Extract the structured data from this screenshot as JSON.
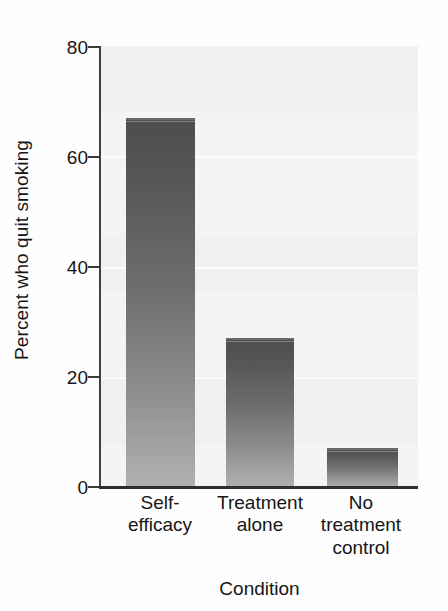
{
  "chart_data": {
    "type": "bar",
    "title": "",
    "xlabel": "Condition",
    "ylabel": "Percent who quit smoking",
    "categories": [
      "Self-\nefficacy",
      "Treatment\nalone",
      "No\ntreatment\ncontrol"
    ],
    "category_labels": [
      [
        "Self-",
        "efficacy"
      ],
      [
        "Treatment",
        "alone"
      ],
      [
        "No",
        "treatment",
        "control"
      ]
    ],
    "values": [
      67,
      27,
      7
    ],
    "ylim": [
      0,
      80
    ],
    "yticks": [
      0,
      20,
      40,
      60,
      80
    ],
    "ytick_labels": [
      "0",
      "20",
      "40",
      "60",
      "80"
    ],
    "grid": true,
    "grid_axis": "y",
    "legend": false,
    "bar_fill": "#6e6e6e",
    "bar_fill_top": "#4d4d4d",
    "bar_fill_bottom": "#b0b0b0",
    "plot_background": "#f4f4f4",
    "axis_color": "#2e2e2e",
    "text_color": "#161616"
  },
  "axes": {
    "y_title": "Percent who quit smoking",
    "x_title": "Condition"
  }
}
